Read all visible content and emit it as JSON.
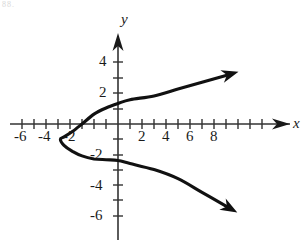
{
  "figure": {
    "corner_note": "88.",
    "axes": {
      "x_name": "x",
      "y_name": "y",
      "x_range": [
        -7.2,
        9.3
      ],
      "y_range": [
        -7.4,
        5.2
      ],
      "origin_px": [
        118,
        124
      ],
      "unit_px_x": 12,
      "unit_px_y": 15.2,
      "x_tick_labels": [
        "-6",
        "-4",
        "-2",
        "2",
        "4",
        "6",
        "8"
      ],
      "x_tick_values": [
        -6,
        -4,
        -2,
        2,
        4,
        6,
        8
      ],
      "y_tick_labels": [
        "4",
        "2",
        "-2",
        "-4",
        "-6"
      ],
      "y_tick_values": [
        4,
        2,
        -2,
        -4,
        -6
      ],
      "x_minor_ticks": [
        -7,
        -6,
        -5,
        -4,
        -3,
        -2,
        -1,
        1,
        2,
        3,
        4,
        5,
        6,
        7,
        8
      ],
      "y_minor_ticks": [
        1,
        2,
        3,
        4,
        -1,
        -2,
        -3,
        -4,
        -5,
        -6
      ],
      "grid": false,
      "arrowheads": [
        "x-positive",
        "y-positive"
      ]
    }
  },
  "chart_data": {
    "type": "line",
    "title": "",
    "xlabel": "x",
    "ylabel": "y",
    "xlim": [
      -7.2,
      9.3
    ],
    "ylim": [
      -7.4,
      5.2
    ],
    "grid": false,
    "legend": null,
    "series": [
      {
        "name": "sideways-parabola",
        "orientation": "opens-right",
        "vertex": [
          -4.8,
          -1.0
        ],
        "x_intercepts": [
          -3.0
        ],
        "y_intercepts": [
          1.35,
          -2.4
        ],
        "points": [
          [
            9.0,
            3.2
          ],
          [
            7.0,
            2.75
          ],
          [
            5.0,
            2.3
          ],
          [
            3.0,
            1.85
          ],
          [
            1.0,
            1.6
          ],
          [
            0.0,
            1.35
          ],
          [
            -1.0,
            1.05
          ],
          [
            -2.0,
            0.65
          ],
          [
            -3.0,
            0.0
          ],
          [
            -3.8,
            -0.5
          ],
          [
            -4.5,
            -0.85
          ],
          [
            -4.8,
            -1.0
          ],
          [
            -4.5,
            -1.4
          ],
          [
            -3.8,
            -1.8
          ],
          [
            -3.0,
            -2.1
          ],
          [
            -2.0,
            -2.3
          ],
          [
            -1.0,
            -2.35
          ],
          [
            0.0,
            -2.4
          ],
          [
            1.0,
            -2.6
          ],
          [
            3.0,
            -3.0
          ],
          [
            5.0,
            -3.6
          ],
          [
            7.0,
            -4.5
          ],
          [
            9.0,
            -5.4
          ]
        ]
      }
    ],
    "annotations": []
  }
}
